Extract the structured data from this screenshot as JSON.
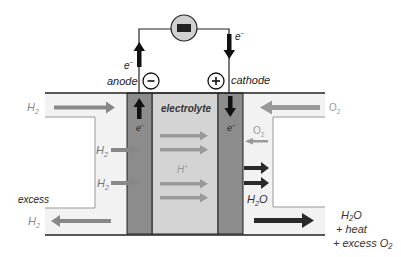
{
  "diagram": {
    "colors": {
      "background": "#ffffff",
      "electrode": "#8c8c8c",
      "electrolyte": "#d4d4d4",
      "channel_fill": "#f2f2f2",
      "outline": "#222222",
      "gas_arrow": "#888888",
      "ion_arrow": "#999999",
      "water_arrow": "#2a2a2a",
      "o2_label": "#9a9a9a",
      "h2_label": "#8a8a8a",
      "resistor_fill": "#d0d0d0"
    },
    "labels": {
      "anode": "anode",
      "cathode": "cathode",
      "electrolyte": "electrolyte",
      "anode_sign": "−",
      "cathode_sign": "+",
      "electron": "e",
      "electron_charge": "−",
      "h2_in": "H",
      "h2_sub": "2",
      "h2_inner_1": "H",
      "h2_inner_2": "H",
      "h2_out": "H",
      "proton": "H",
      "proton_charge": "+",
      "o2_in": "O",
      "o2_sub": "2",
      "o2_inner": "O",
      "water": "H",
      "water_sub": "2",
      "water_o": "O",
      "excess": "excess",
      "out_water": "H₂O",
      "out_heat": "+ heat",
      "out_excess_o2": "+ excess O₂"
    },
    "components": [
      "external-circuit",
      "load-resistor",
      "anode",
      "electrolyte",
      "cathode",
      "hydrogen-inlet-channel",
      "oxygen-inlet-channel"
    ]
  }
}
